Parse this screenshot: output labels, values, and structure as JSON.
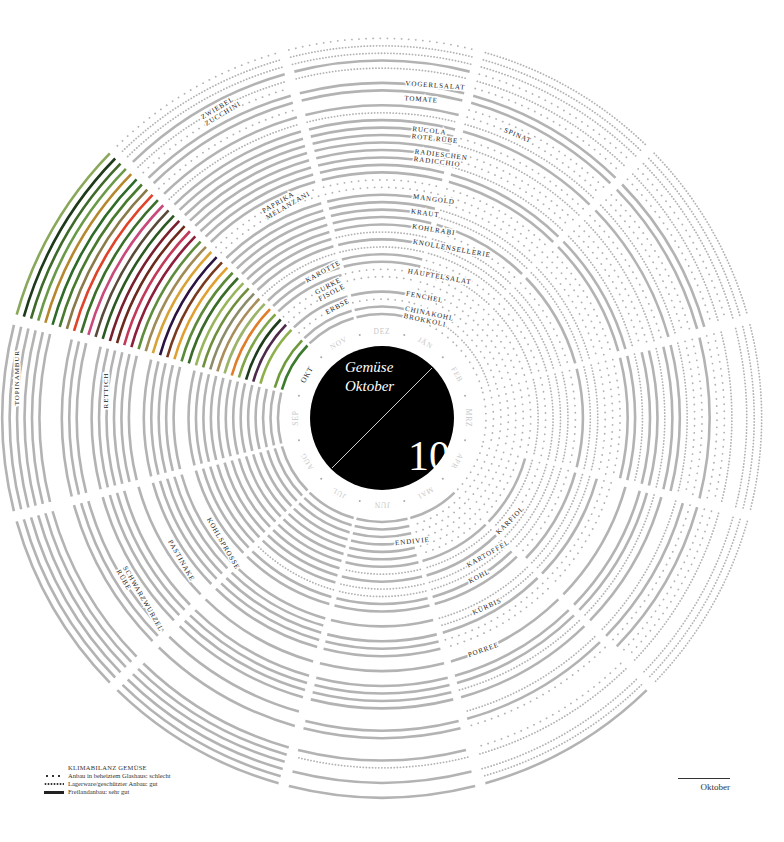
{
  "center": {
    "title_line1": "Gemüse",
    "title_line2": "Oktober",
    "month_number": "10"
  },
  "months": [
    "JÄN",
    "FEB",
    "MRZ",
    "APR",
    "MAI",
    "JUN",
    "JUL",
    "AUG",
    "SEP",
    "OKT",
    "NOV",
    "DEZ"
  ],
  "current_month_index": 9,
  "legend": {
    "title": "KLIMABILANZ GEMÜSE",
    "items": [
      {
        "style": "sparse",
        "label": "Anbau in beheiztem Glashaus: schlecht"
      },
      {
        "style": "dense",
        "label": "Lagerware/geschützter Anbau: gut"
      },
      {
        "style": "solid",
        "label": "Freilandanbau: sehr gut"
      }
    ]
  },
  "caption": "Oktober",
  "colors": {
    "inactive": "#b3b3b3",
    "center": "#000000",
    "month_label": "#c8c8c8",
    "label": "#222222"
  },
  "chart_data": {
    "type": "radial-calendar",
    "rings": [
      {
        "name": "BROKKOLI",
        "codes": "ppppssssssss",
        "color": "#3d7a2e"
      },
      {
        "name": "CHINAKOHL",
        "codes": "ddpppsssssss",
        "color": "#6e9a3b"
      },
      {
        "name": "ERBSE",
        "codes": "pppppssss-pp",
        "color": "#5a8f35"
      },
      {
        "name": "FENCHEL",
        "codes": "pppppsssssss",
        "color": "#8db04a"
      },
      {
        "name": "FISOLE",
        "codes": "pppppsssssp-",
        "color": "#4e2a4a"
      },
      {
        "name": "GURKE",
        "codes": "pppppssssspp",
        "color": "#1f3d1c"
      },
      {
        "name": "HÄUPTELSALAT",
        "codes": "pppssssssssp",
        "color": "#7ea548"
      },
      {
        "name": "KAROTTE",
        "codes": "ddddddssssss",
        "color": "#e07d2a"
      },
      {
        "name": "KARFIOL",
        "codes": "ppppssssssss",
        "color": "#9bb36a"
      },
      {
        "name": "KARTOFFEL",
        "codes": "ddddddssssdd",
        "color": "#a98e5c"
      },
      {
        "name": "KNOLLENSELLERIE",
        "codes": "dddddddsssss",
        "color": "#8c8c6a"
      },
      {
        "name": "KOHL",
        "codes": "ddddsssssssd",
        "color": "#6f8f3c"
      },
      {
        "name": "KOHLRABI",
        "codes": "ppppssssssss",
        "color": "#98b55c"
      },
      {
        "name": "KOHLSPROSSE",
        "codes": "ssss-----sss",
        "color": "#3a6b2a"
      },
      {
        "name": "KRAUT",
        "codes": "dddddsssssss",
        "color": "#5d8a3a"
      },
      {
        "name": "KÜRBIS",
        "codes": "ddddd-ssssss",
        "color": "#e0a030"
      },
      {
        "name": "MANGOLD",
        "codes": "pppsssssssss",
        "color": "#7a3a1e"
      },
      {
        "name": "MELANZANI",
        "codes": "pppppssssspp",
        "color": "#2b1440"
      },
      {
        "name": "PAPRIKA",
        "codes": "pppppssssspp",
        "color": "#d9a236"
      },
      {
        "name": "PASTINAKE",
        "codes": "sss------sss",
        "color": "#a08a55"
      },
      {
        "name": "PORREE",
        "codes": "ssssssssssss",
        "color": "#5f8c3d"
      },
      {
        "name": "RADICCHIO",
        "codes": "ddd-----ssss",
        "color": "#8c1f3c"
      },
      {
        "name": "RADIESCHEN",
        "codes": "ppssssssssss",
        "color": "#c23a5a"
      },
      {
        "name": "RETTICH",
        "codes": "ppssssssssss",
        "color": "#6b2a1a"
      },
      {
        "name": "ROTE RÜBE",
        "codes": "dddddsssssss",
        "color": "#7a1f2e"
      },
      {
        "name": "RUCOLA",
        "codes": "ppssssssssss",
        "color": "#2d5a22"
      },
      {
        "name": "SCHWARZWURZEL",
        "codes": "sss------sss",
        "color": "#5a4a3a"
      },
      {
        "name": "RÜBE",
        "codes": "ddddd-ssssdd",
        "color": "#c94a7a"
      },
      {
        "name": "SPINAT",
        "codes": "pppsss-sssss",
        "color": "#3c6f2a"
      },
      {
        "name": "TOMATE",
        "codes": "pppppsssssp-",
        "color": "#e0432a"
      },
      {
        "name": "TOPINAMBUR",
        "codes": "ssss-----sss",
        "color": "#8a7a4a"
      },
      {
        "name": "VOGERLSALAT",
        "codes": "sspp-----sss",
        "color": "#4a7a2e"
      },
      {
        "name": "ZUCCHINI",
        "codes": "pppppsssssp-",
        "color": "#2e6a28"
      },
      {
        "name": "ZWIEBEL",
        "codes": "ddddddssssdd",
        "color": "#b5872e"
      },
      {
        "name": "ENDIVIE",
        "codes": "pp----ssssss",
        "color": "#6a9a48"
      },
      {
        "name": "KAROTTE II",
        "codes": "dddddsssssdd",
        "color": "#3f6a2a"
      },
      {
        "name": "KRAUT II",
        "codes": "ddddd-ssssdd",
        "color": "#1e3a1a"
      },
      {
        "name": "KOHL II",
        "codes": "ddddsssssspp",
        "color": "#8aa85a"
      }
    ],
    "labels": [
      {
        "text": "CHINAKOHL",
        "ring": 1,
        "angle": -78
      },
      {
        "text": "BROKKOLI",
        "ring": 0,
        "angle": -78
      },
      {
        "text": "ERBSE",
        "ring": 2,
        "angle": -118
      },
      {
        "text": "FISOLE",
        "ring": 4,
        "angle": -118
      },
      {
        "text": "GURKE",
        "ring": 5,
        "angle": -118
      },
      {
        "text": "FENCHEL",
        "ring": 3,
        "angle": -79
      },
      {
        "text": "HÄUPTELSALAT",
        "ring": 6,
        "angle": -80
      },
      {
        "text": "KAROTTE",
        "ring": 7,
        "angle": -119
      },
      {
        "text": "KNOLLENSELLERIE",
        "ring": 10,
        "angle": -80
      },
      {
        "text": "KOHLRABI",
        "ring": 12,
        "angle": -81
      },
      {
        "text": "KRAUT",
        "ring": 14,
        "angle": -82
      },
      {
        "text": "MANGOLD",
        "ring": 16,
        "angle": -82
      },
      {
        "text": "MELANZANI",
        "ring": 17,
        "angle": -120
      },
      {
        "text": "PAPRIKA",
        "ring": 18,
        "angle": -120
      },
      {
        "text": "RADICCHIO",
        "ring": 21,
        "angle": -83
      },
      {
        "text": "RADIESCHEN",
        "ring": 22,
        "angle": -83
      },
      {
        "text": "ROTE RÜBE",
        "ring": 24,
        "angle": -84
      },
      {
        "text": "RUCOLA",
        "ring": 25,
        "angle": -84
      },
      {
        "text": "SPINAT",
        "ring": 28,
        "angle": -67
      },
      {
        "text": "TOMATE",
        "ring": 29,
        "angle": -86
      },
      {
        "text": "VOGERLSALAT",
        "ring": 31,
        "angle": -86
      },
      {
        "text": "ZUCCHINI",
        "ring": 32,
        "angle": -121
      },
      {
        "text": "ZWIEBEL",
        "ring": 33,
        "angle": -121
      },
      {
        "text": "ENDIVIE",
        "ring": 3,
        "angle": 84
      },
      {
        "text": "KARTOFFEL",
        "ring": 9,
        "angle": 60
      },
      {
        "text": "KARFIOL",
        "ring": 8,
        "angle": 45
      },
      {
        "text": "KOHL",
        "ring": 11,
        "angle": 62
      },
      {
        "text": "KÜRBIS",
        "ring": 15,
        "angle": 65
      },
      {
        "text": "PORREE",
        "ring": 20,
        "angle": 70
      },
      {
        "text": "TOPINAMBUR",
        "ring": 35,
        "angle": -178
      },
      {
        "text": "RETTICH",
        "ring": 23,
        "angle": -178
      },
      {
        "text": "KOHLSPROSSE",
        "ring": 13,
        "angle": 150
      },
      {
        "text": "PASTINAKE",
        "ring": 19,
        "angle": 150
      },
      {
        "text": "SCHWARZWURZEL",
        "ring": 26,
        "angle": 150
      },
      {
        "text": "RÜBE",
        "ring": 27,
        "angle": 150
      }
    ]
  }
}
